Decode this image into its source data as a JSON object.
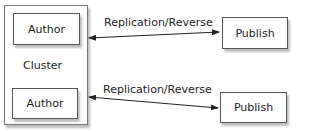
{
  "diagram": {
    "cluster": {
      "label": "Cluster"
    },
    "authors": [
      {
        "label": "Author"
      },
      {
        "label": "Author"
      }
    ],
    "publishers": [
      {
        "label": "Publish"
      },
      {
        "label": "Publish"
      }
    ],
    "connections": [
      {
        "label": "Replication/Reverse",
        "from": "Author",
        "to": "Publish",
        "bidirectional": true
      },
      {
        "label": "Replication/Reverse",
        "from": "Author",
        "to": "Publish",
        "bidirectional": true
      }
    ]
  }
}
